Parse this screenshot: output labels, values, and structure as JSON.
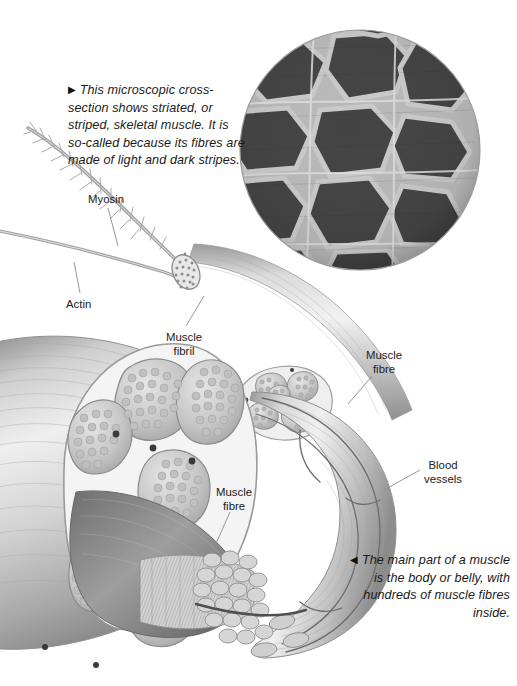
{
  "page": {
    "width": 517,
    "height": 686,
    "background": "#ffffff",
    "topic": "Skeletal muscle structure illustration"
  },
  "captions": {
    "top": {
      "marker": "▶",
      "text": "This microscopic cross-section shows striated, or striped, skeletal muscle. It is so-called because its fibres are made of light and dark stripes.",
      "align": "left",
      "style": "italic"
    },
    "bottom": {
      "marker": "◀",
      "text": "The main part of a muscle is the body or belly, with hundreds of muscle fibres inside.",
      "align": "right",
      "style": "italic"
    }
  },
  "labels": [
    {
      "id": "myosin",
      "text": "Myosin",
      "line1": "Myosin",
      "line2": ""
    },
    {
      "id": "actin",
      "text": "Actin",
      "line1": "Actin",
      "line2": ""
    },
    {
      "id": "muscle-fibril",
      "text": "Muscle fibril",
      "line1": "Muscle",
      "line2": "fibril"
    },
    {
      "id": "muscle-fibre-top-right",
      "text": "Muscle fibre",
      "line1": "Muscle",
      "line2": "fibre"
    },
    {
      "id": "blood-vessels",
      "text": "Blood vessels",
      "line1": "Blood",
      "line2": "vessels"
    },
    {
      "id": "muscle-fibre-bottom-left",
      "text": "Muscle fibre",
      "line1": "Muscle",
      "line2": "fibre"
    }
  ],
  "micrograph": {
    "name": "striated-muscle-cross-section",
    "shape": "circle",
    "center_x": 360,
    "center_y": 150,
    "radius": 120,
    "palette": {
      "cell_dark": "#4a4a4a",
      "cell_darker": "#3c3c3c",
      "septa_light": "#bdbdbd",
      "septa_highlight": "#d8d8d8",
      "edge_shadow": "#5a5a5a"
    }
  },
  "colors": {
    "ink": "#222222",
    "leader": "#8c8c8c",
    "tissue_light": "#e3e3e3",
    "tissue_mid": "#b8b8b8",
    "tissue_dark": "#8a8a8a",
    "tissue_shadow": "#6d6d6d",
    "outline": "#9a9a9a",
    "vessel": "#6f6f6f"
  },
  "figure_parts": {
    "myosin_filament": "thin curved filament with cross-bridge projections",
    "actin_filament": "thin smooth curved filament",
    "fibril_tube": "cylindrical muscle fibril with speckled circular cross-section",
    "fibre_bundle_top_right": "bundle of five fascicles in cross-section",
    "muscle_belly": "large muscle body cut open showing fascicles",
    "fibre_bundle_bottom": "packed cylindrical muscle fibres shown end-on",
    "blood_vessels": "vessel strands running along the muscle belly"
  }
}
